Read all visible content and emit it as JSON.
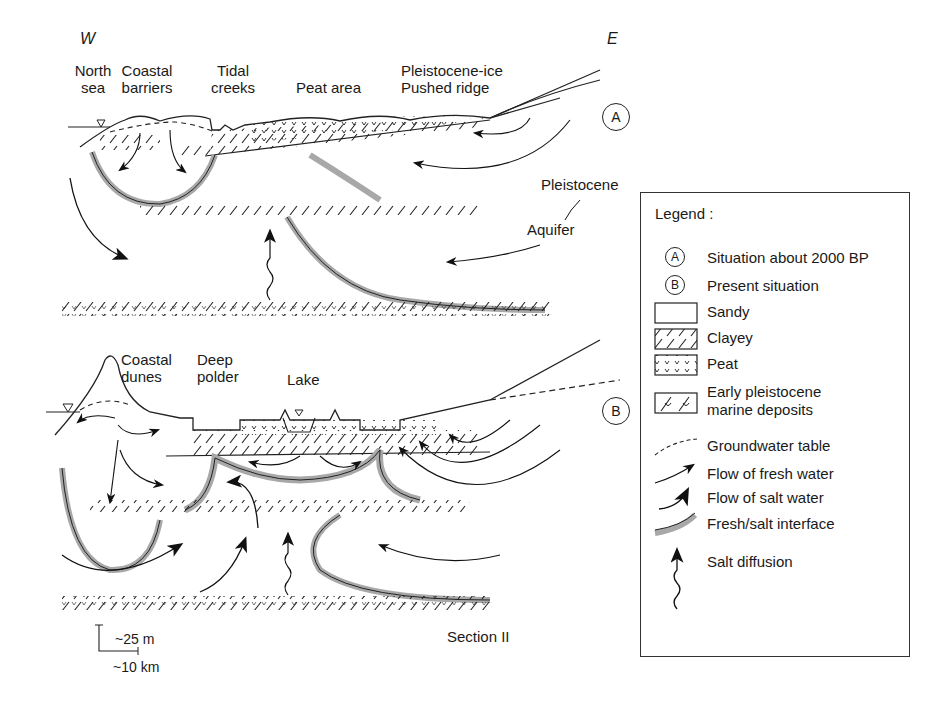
{
  "directions": {
    "west": "W",
    "east": "E"
  },
  "panel_a": {
    "marker": "A",
    "labels": {
      "north_sea": [
        "North",
        "sea"
      ],
      "coastal_barriers": [
        "Coastal",
        "barriers"
      ],
      "tidal_creeks": [
        "Tidal",
        "creeks"
      ],
      "peat_area": "Peat area",
      "pushed_ridge": [
        "Pleistocene-ice",
        "Pushed ridge"
      ],
      "pleistocene": "Pleistocene",
      "aquifer": "Aquifer"
    }
  },
  "panel_b": {
    "marker": "B",
    "labels": {
      "coastal_dunes": [
        "Coastal",
        "dunes"
      ],
      "deep_polder": [
        "Deep",
        "polder"
      ],
      "lake": "Lake",
      "section": "Section II"
    }
  },
  "scale": {
    "vertical": "~25 m",
    "horizontal": "~10 km"
  },
  "legend": {
    "title": "Legend :",
    "items": [
      {
        "symbol": "circle-A",
        "label": "Situation about 2000 BP"
      },
      {
        "symbol": "circle-B",
        "label": "Present situation"
      },
      {
        "symbol": "sandy-box",
        "label": "Sandy"
      },
      {
        "symbol": "clayey-hatch",
        "label": "Clayey"
      },
      {
        "symbol": "peat-pattern",
        "label": "Peat"
      },
      {
        "symbol": "marine-pattern",
        "label": [
          "Early pleistocene",
          "marine deposits"
        ]
      },
      {
        "symbol": "dashed-line",
        "label": "Groundwater table"
      },
      {
        "symbol": "thin-arrow",
        "label": "Flow of fresh water"
      },
      {
        "symbol": "bold-arrow",
        "label": "Flow of salt water"
      },
      {
        "symbol": "grey-band",
        "label": "Fresh/salt interface"
      },
      {
        "symbol": "wavy-arrow",
        "label": "Salt diffusion"
      }
    ]
  },
  "colors": {
    "ink": "#1a1a1a",
    "interface": "#a8a8a8",
    "background": "#ffffff"
  }
}
